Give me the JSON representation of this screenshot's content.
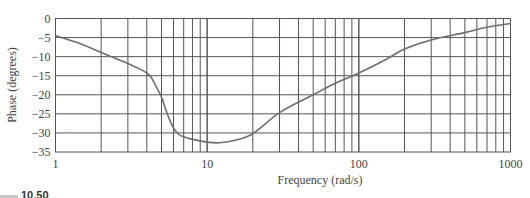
{
  "chart_data": {
    "type": "line",
    "title": "",
    "xlabel": "Frequency (rad/s)",
    "ylabel": "Phase (degrees)",
    "xscale": "log",
    "xlim": [
      1,
      1000
    ],
    "ylim": [
      -35,
      0
    ],
    "grid": true,
    "legend": null,
    "x_ticks": [
      1,
      10,
      100,
      1000
    ],
    "x_tick_labels": [
      "1",
      "10",
      "100",
      "1000"
    ],
    "y_ticks": [
      0,
      -5,
      -10,
      -15,
      -20,
      -25,
      -30,
      -35
    ],
    "y_tick_labels": [
      "0",
      "−5",
      "−10",
      "−15",
      "−20",
      "−25",
      "−30",
      "−35"
    ],
    "series": [
      {
        "name": "Phase",
        "color": "#6e6e6e",
        "x": [
          1,
          1.5,
          2,
          2.5,
          3,
          3.5,
          4,
          4.3,
          4.6,
          5,
          5.3,
          5.6,
          6,
          6.5,
          7,
          8,
          10,
          12,
          15,
          20,
          30,
          50,
          70,
          100,
          150,
          200,
          300,
          500,
          700,
          1000
        ],
        "y": [
          -4.5,
          -6.8,
          -8.9,
          -10.5,
          -11.8,
          -13.0,
          -14.3,
          -15.6,
          -17.8,
          -20.6,
          -23.5,
          -26.2,
          -28.7,
          -30.4,
          -31.0,
          -31.7,
          -32.4,
          -32.6,
          -32.0,
          -30.2,
          -24.7,
          -20.0,
          -17.0,
          -14.3,
          -10.8,
          -8.0,
          -5.6,
          -3.7,
          -2.3,
          -1.3
        ]
      }
    ]
  },
  "caption": "10.50"
}
